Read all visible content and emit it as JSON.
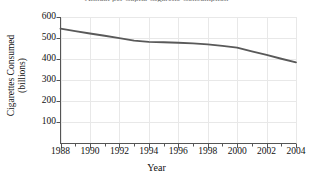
{
  "chart_data": {
    "type": "line",
    "title": "Annual per Capita Cigarette Consumption",
    "xlabel": "Year",
    "ylabel_line1": "Cigarettes Consumed",
    "ylabel_line2": "(billions)",
    "x": [
      1988,
      1989,
      1990,
      1991,
      1992,
      1993,
      1994,
      1995,
      1996,
      1997,
      1998,
      1999,
      2000,
      2001,
      2002,
      2003,
      2004
    ],
    "values": [
      545,
      533,
      522,
      511,
      500,
      488,
      482,
      480,
      478,
      475,
      470,
      463,
      455,
      437,
      420,
      402,
      385
    ],
    "series": [
      {
        "name": "Cigarettes Consumed (billions)",
        "values": [
          545,
          533,
          522,
          511,
          500,
          488,
          482,
          480,
          478,
          475,
          470,
          463,
          455,
          437,
          420,
          402,
          385
        ]
      }
    ],
    "xlim": [
      1988,
      2004
    ],
    "ylim": [
      0,
      600
    ],
    "ytick_labels": [
      "600",
      "500",
      "400",
      "300",
      "200",
      "100"
    ],
    "ytick_values": [
      600,
      500,
      400,
      300,
      200,
      100
    ],
    "xtick_labels": [
      "1988",
      "1990",
      "1992",
      "1994",
      "1996",
      "1998",
      "2000",
      "2002",
      "2004"
    ],
    "xtick_values": [
      1988,
      1990,
      1992,
      1994,
      1996,
      1998,
      2000,
      2002,
      2004
    ],
    "x_minor_tick_step": 1,
    "grid": true,
    "legend": "none",
    "line_color": "#595959",
    "grid_color": "#e8e8e8",
    "axis_color": "#555555",
    "background": "#ffffff"
  }
}
